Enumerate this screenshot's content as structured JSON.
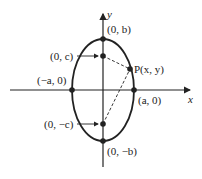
{
  "diagram": {
    "axes": {
      "x_label": "x",
      "y_label": "y"
    },
    "points": {
      "top_vertex": "(0, b)",
      "bottom_vertex": "(0, −b)",
      "left_vertex": "(−a, 0)",
      "right_vertex": "(a, 0)",
      "focus_top": "(0, c)",
      "focus_bottom": "(0, −c)",
      "point_p": "P(x, y)"
    },
    "colors": {
      "stroke": "#222222",
      "background": "#ffffff"
    }
  }
}
